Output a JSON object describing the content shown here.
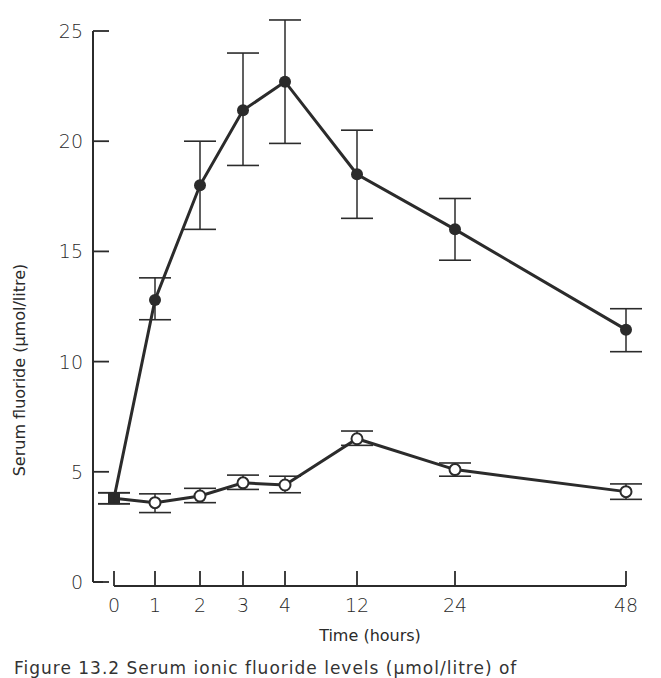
{
  "chart_data": {
    "type": "line",
    "title": "",
    "xlabel": "Time (hours)",
    "ylabel": "Serum fluoride (μmol/litre)",
    "ylim": [
      0,
      25
    ],
    "yticks": [
      0,
      5,
      10,
      15,
      20,
      25
    ],
    "x": [
      "0",
      "1",
      "2",
      "3",
      "4",
      "12",
      "24",
      "48"
    ],
    "x_scale": "categorical (non-linear time axis)",
    "grid": false,
    "legend": "none",
    "series": [
      {
        "name": "filled circles",
        "marker": "filled-circle",
        "values": [
          3.8,
          12.8,
          18.0,
          21.4,
          22.7,
          18.5,
          16.0,
          11.45
        ],
        "err_low": [
          3.55,
          11.9,
          16.0,
          18.9,
          19.9,
          16.5,
          14.6,
          10.45
        ],
        "err_high": [
          4.05,
          13.8,
          20.0,
          24.0,
          25.5,
          20.5,
          17.4,
          12.4
        ]
      },
      {
        "name": "open circles",
        "marker": "open-circle",
        "values": [
          3.8,
          3.6,
          3.9,
          4.5,
          4.4,
          6.5,
          5.1,
          4.1
        ],
        "err_low": [
          3.55,
          3.15,
          3.6,
          4.2,
          4.05,
          6.2,
          4.8,
          3.75
        ],
        "err_high": [
          4.05,
          4.0,
          4.25,
          4.85,
          4.8,
          6.85,
          5.4,
          4.45
        ]
      }
    ]
  },
  "caption": "Figure 13.2  Serum ionic fluoride levels (μmol/litre) of"
}
